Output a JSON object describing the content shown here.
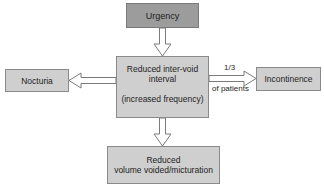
{
  "diagram": {
    "nodes": {
      "urgency": {
        "label": "Urgency"
      },
      "main": {
        "line1": "Reduced inter-void",
        "line2": "interval",
        "line3": "(increased frequency)"
      },
      "nocturia": {
        "label": "Nocturia"
      },
      "incontinence": {
        "label": "Incontinence"
      },
      "bottom": {
        "line1": "Reduced",
        "line2": "volume voided/micturation"
      }
    },
    "edges": {
      "to_incontinence": {
        "label_top": "1/3",
        "label_bottom": "of patients"
      }
    },
    "colors": {
      "box_fill": "#cfcfcf",
      "urgency_fill": "#9c9c9c",
      "border": "#8a8a8a",
      "arrow_stroke": "#7a7a7a"
    }
  }
}
